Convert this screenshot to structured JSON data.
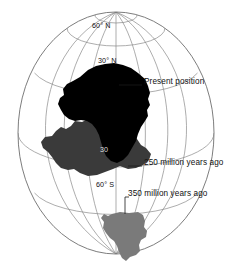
{
  "figure": {
    "type": "map-diagram",
    "background_color": "#ffffff"
  },
  "globe": {
    "outline_color": "#6e6e6e",
    "graticule_color": "#8a8a8a",
    "center_x": 116,
    "center_y": 133,
    "radius": 119,
    "meridian_spacing_degrees": 30,
    "parallel_spacing_degrees": 30
  },
  "graticule_labels": [
    {
      "id": "lat-60n",
      "text": "60",
      "degree": "°",
      "hemisphere": "N",
      "full": "60° N",
      "x": 92,
      "y": 27
    },
    {
      "id": "lat-30n",
      "text": "30",
      "degree": "°",
      "hemisphere": "N",
      "full": "30° N",
      "x": 98,
      "y": 62
    },
    {
      "id": "lat-30s",
      "text": "30",
      "degree": "",
      "hemisphere": "",
      "full": "30",
      "x": 100,
      "y": 150
    },
    {
      "id": "lat-60s",
      "text": "60",
      "degree": "°",
      "hemisphere": "S",
      "full": "60° S",
      "x": 96,
      "y": 186
    }
  ],
  "annotations": [
    {
      "id": "present-position",
      "label": "Present position",
      "label_x": 144,
      "label_y": 82,
      "leader_from_x": 134,
      "leader_from_y": 85,
      "leader_to_x": 119,
      "leader_to_y": 85,
      "shape_color": "#000000",
      "shape_name": "africa-present"
    },
    {
      "id": "250-million-years-ago",
      "label": "250 million years ago",
      "label_x": 144,
      "label_y": 163,
      "leader_from_x": 141,
      "leader_from_y": 166,
      "leader_to_x": 128,
      "leader_to_y": 166,
      "shape_color": "#3a3a3a",
      "shape_name": "africa-250ma"
    },
    {
      "id": "350-million-years-ago",
      "label": "350 million years ago",
      "label_x": 128,
      "label_y": 194,
      "leader_from_x": 125,
      "leader_from_y": 197,
      "leader_to_x": 125,
      "leader_to_y": 214,
      "shape_color": "#7a7a7a",
      "shape_name": "africa-350ma"
    }
  ],
  "landmasses": [
    {
      "id": "africa-present",
      "name": "Africa — present position",
      "fill": "#000000"
    },
    {
      "id": "africa-250ma",
      "name": "Africa — 250 million years ago",
      "fill": "#3a3a3a"
    },
    {
      "id": "africa-350ma",
      "name": "Africa — 350 million years ago",
      "fill": "#7a7a7a"
    }
  ]
}
